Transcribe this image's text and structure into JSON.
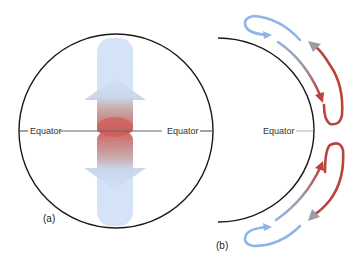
{
  "panel_a": {
    "label": "(a)",
    "equator_left": "Equator",
    "equator_right": "Equator"
  },
  "panel_b": {
    "label": "(b)",
    "equator": "Equator"
  },
  "colors": {
    "cold": "#8fb4e8",
    "warm": "#b8443a",
    "outline": "#1a1a1a",
    "equator_line": "#666666"
  }
}
